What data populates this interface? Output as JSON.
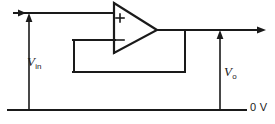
{
  "figure": {
    "type": "schematic",
    "background_color": "#ffffff",
    "line_color": "#1a1a1a"
  },
  "component": {
    "name": "operational-amplifier",
    "symbol": "triangle",
    "noninverting_input_label": "+",
    "inverting_input_label": "−"
  },
  "labels": {
    "input_voltage": {
      "symbol": "V",
      "subscript": "in"
    },
    "output_voltage": {
      "symbol": "V",
      "subscript": "o"
    },
    "ground_rail": "0 V"
  },
  "nodes": {
    "input_arrow_direction": "right",
    "output_arrow_direction": "right",
    "vin_arrow_direction": "up",
    "vo_arrow_direction": "up"
  }
}
